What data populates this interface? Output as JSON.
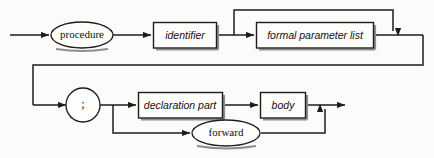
{
  "diagram": {
    "type": "railroad-syntax-diagram",
    "colors": {
      "background": "#fbfbfa",
      "line": "#1d1d1d",
      "shadow": "#8f8f8f",
      "node_fill": "#fdfdfc",
      "text": "#111111"
    },
    "nodes": [
      {
        "id": "procedure",
        "label": "procedure",
        "shape": "oval",
        "style": "terminal",
        "row": 1
      },
      {
        "id": "identifier",
        "label": "identifier",
        "shape": "rect",
        "style": "nonterminal",
        "row": 1
      },
      {
        "id": "formal-parameter-list",
        "label": "formal parameter list",
        "shape": "rect",
        "style": "nonterminal",
        "row": 1
      },
      {
        "id": "semicolon",
        "label": ";",
        "shape": "circle",
        "style": "terminal",
        "row": 2
      },
      {
        "id": "declaration-part",
        "label": "declaration part",
        "shape": "rect",
        "style": "nonterminal",
        "row": 2
      },
      {
        "id": "body",
        "label": "body",
        "shape": "rect",
        "style": "nonterminal",
        "row": 2
      },
      {
        "id": "forward",
        "label": "forward",
        "shape": "oval",
        "style": "terminal",
        "row": 3
      }
    ],
    "edges": [
      {
        "from": "start",
        "to": "procedure",
        "kind": "sequence",
        "arrow": true
      },
      {
        "from": "procedure",
        "to": "identifier",
        "kind": "sequence",
        "arrow": true
      },
      {
        "from": "identifier",
        "to": "formal-parameter-list",
        "kind": "sequence",
        "arrow": true
      },
      {
        "from": "identifier",
        "to": "row1-join",
        "kind": "bypass",
        "arrow": true
      },
      {
        "from": "formal-parameter-list",
        "to": "row1-join",
        "kind": "sequence",
        "arrow": false
      },
      {
        "from": "row1-join",
        "to": "semicolon",
        "kind": "wrap",
        "arrow": true
      },
      {
        "from": "semicolon",
        "to": "declaration-part",
        "kind": "alternate",
        "arrow": true
      },
      {
        "from": "declaration-part",
        "to": "body",
        "kind": "sequence",
        "arrow": true
      },
      {
        "from": "semicolon",
        "to": "forward",
        "kind": "alternate",
        "arrow": true
      },
      {
        "from": "forward",
        "to": "row2-join",
        "kind": "merge",
        "arrow": true
      },
      {
        "from": "body",
        "to": "end",
        "kind": "sequence",
        "arrow": true
      }
    ],
    "arrow_count": 9,
    "branch_points": [
      "identifier-exit",
      "semicolon-exit"
    ],
    "merge_points": [
      "formal-parameter-list-exit",
      "body-exit"
    ]
  }
}
